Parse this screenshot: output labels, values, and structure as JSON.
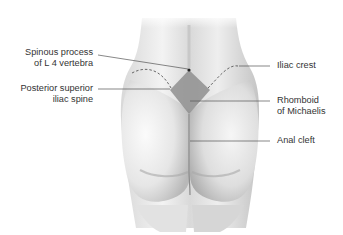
{
  "diagram": {
    "labels_left": [
      {
        "line1": "Spinous process",
        "line2": "of L 4 vertebra"
      },
      {
        "line1": "Posterior superior",
        "line2": "iliac spine"
      }
    ],
    "labels_right": [
      {
        "line1": "Iliac crest",
        "line2": ""
      },
      {
        "line1": "Rhomboid",
        "line2": "of Michaelis"
      },
      {
        "line1": "Anal cleft",
        "line2": ""
      }
    ],
    "colors": {
      "line": "#555555",
      "rhomboid": "#8f8f8f",
      "skin_light": "#f2f2f2",
      "skin_shadow": "#bdbdbd",
      "text": "#333333"
    }
  }
}
